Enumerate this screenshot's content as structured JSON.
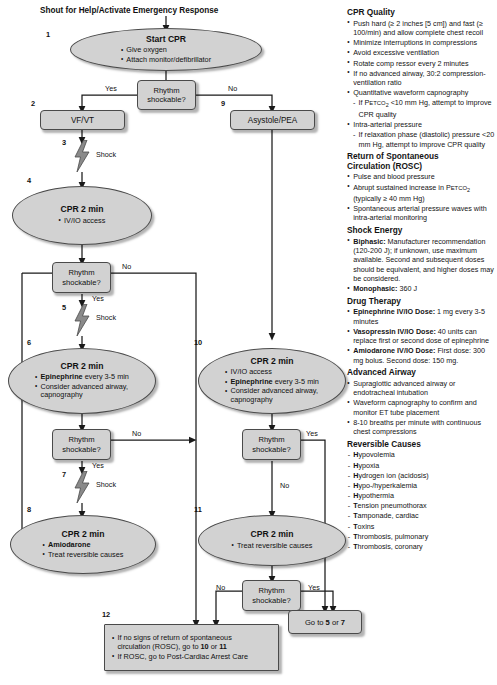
{
  "flow": {
    "top_text": "Shout for Help/Activate Emergency Response",
    "labels": {
      "yes": "Yes",
      "no": "No",
      "shock": "Shock"
    },
    "nodes": {
      "n1": {
        "num": "1",
        "title": "Start CPR",
        "lines": [
          "Give oxygen",
          "Attach monitor/defibrillator"
        ]
      },
      "d1": {
        "line1": "Rhythm",
        "line2": "shockable?"
      },
      "n2": {
        "num": "2",
        "label": "VF/VT"
      },
      "n3": {
        "num": "3",
        "label": "Shock"
      },
      "n4": {
        "num": "4",
        "title": "CPR 2 min",
        "lines": [
          "IV/IO access"
        ]
      },
      "d2": {
        "line1": "Rhythm",
        "line2": "shockable?"
      },
      "n5": {
        "num": "5",
        "label": "Shock"
      },
      "n6": {
        "num": "6",
        "title": "CPR 2 min",
        "line1_bold": "Epinephrine",
        "line1_rest": " every 3-5 min",
        "line2": "Consider advanced airway,",
        "line2b": "capnography"
      },
      "d3": {
        "line1": "Rhythm",
        "line2": "shockable?"
      },
      "n7": {
        "num": "7",
        "label": "Shock"
      },
      "n8": {
        "num": "8",
        "title": "CPR 2 min",
        "line1_bold": "Amiodarone",
        "line2": "Treat reversible causes"
      },
      "n9": {
        "num": "9",
        "label": "Asystole/PEA"
      },
      "n10": {
        "num": "10",
        "title": "CPR 2 min",
        "line1": "IV/IO access",
        "line2_bold": "Epinephrine",
        "line2_rest": " every 3-5 min",
        "line3": "Consider advanced airway,",
        "line3b": "capnography"
      },
      "d4": {
        "line1": "Rhythm",
        "line2": "shockable?"
      },
      "n11": {
        "num": "11",
        "title": "CPR 2 min",
        "lines": [
          "Treat reversible causes"
        ]
      },
      "d5": {
        "line1": "Rhythm",
        "line2": "shockable?"
      },
      "n12": {
        "num": "12",
        "l1a": "If no signs of return of spontaneous",
        "l1b": "circulation (ROSC), go to ",
        "l1c": "10",
        "l1d": " or ",
        "l1e": "11",
        "l2a": "If ROSC, go to Post-Cardiac Arrest Care"
      },
      "goto": {
        "a": "Go to ",
        "b": "5",
        "c": " or ",
        "d": "7"
      }
    }
  },
  "side": {
    "cpr_quality": {
      "heading": "CPR Quality",
      "items": [
        "Push hard (≥ 2 inches [5 cm]) and fast (≥ 100/min) and allow complete chest recoil",
        "Minimize interruptions in compressions",
        "Avoid excessive ventilation",
        "Rotate comp ressor every 2 minutes",
        "If no advanced airway, 30:2 compression-ventilation ratio"
      ],
      "capnography_item": "Quantitative waveform capnography",
      "capnography_sub_a": "If P",
      "capnography_sub_sc": "ETCO",
      "capnography_sub_2": "2",
      "capnography_sub_b": " <10 mm Hg, attempt to improve CPR quality",
      "pressure_item": "Intra-arterial pressure",
      "pressure_sub": "If relaxation phase (diastolic) pressure <20 mm Hg, attempt to improve CPR quality"
    },
    "rosc": {
      "heading_l1": "Return of Spontaneous",
      "heading_l2": "Circulation (ROSC)",
      "item1": "Pulse and blood pressure",
      "item2_a": "Abrupt sustained increase in P",
      "item2_sc": "ETCO",
      "item2_sub": "2",
      "item2_b": " (typically ≥ 40 mm Hg)",
      "item3": "Spontaneous arterial pressure waves with intra-arterial monitoring"
    },
    "shock_energy": {
      "heading": "Shock Energy",
      "biphasic_label": "Biphasic:",
      "biphasic_text": " Manufacturer recommendation (120-200 J); if unknown, use maximum available. Second and subsequent doses should be equivalent, and higher doses may be considered.",
      "monophasic_label": "Monophasic:",
      "monophasic_text": " 360 J"
    },
    "drug_therapy": {
      "heading": "Drug Therapy",
      "items": [
        {
          "label": "Epinephrine IV/IO Dose:",
          "text": " 1 mg every 3-5 minutes"
        },
        {
          "label": "Vasopressin IV/IO Dose:",
          "text": " 40 units can replace first or second dose of epinephrine"
        },
        {
          "label": "Amiodarone IV/IO Dose:",
          "text": " First dose: 300 mg bolus. Second dose: 150 mg."
        }
      ]
    },
    "advanced_airway": {
      "heading": "Advanced Airway",
      "items": [
        "Supraglottic advanced airway or endotracheal intubation",
        "Waveform capnography to confirm and monitor ET tube placement",
        "8-10 breaths per minute with continuous chest compressions"
      ]
    },
    "reversible_causes": {
      "heading": "Reversible Causes",
      "items": [
        {
          "bold": "H",
          "rest": "ypovolemia"
        },
        {
          "bold": "H",
          "rest": "ypoxia"
        },
        {
          "bold": "H",
          "rest": "ydrogen ion (acidosis)"
        },
        {
          "bold": "H",
          "rest": "ypo-/hyperkalemia"
        },
        {
          "bold": "H",
          "rest": "ypothermia"
        },
        {
          "bold": "T",
          "rest": "ension pneumothorax"
        },
        {
          "bold": "T",
          "rest": "amponade, cardiac"
        },
        {
          "bold": "T",
          "rest": "oxins"
        },
        {
          "bold": "T",
          "rest": "hrombosis, pulmonary"
        },
        {
          "bold": "T",
          "rest": "hrombosis, coronary"
        }
      ]
    }
  },
  "colors": {
    "node_fill": "#d2d2d2",
    "node_border": "#4a4a4a",
    "wire": "#1a1a1a",
    "bolt": "#808080"
  }
}
